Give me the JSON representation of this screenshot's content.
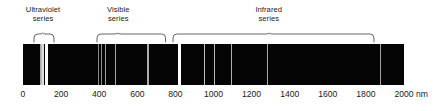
{
  "figure": {
    "axis_unit": "nm",
    "background_color": "#ffffff",
    "band_color": "#050505",
    "text_color": "#1b1b1b",
    "line_color": "#ffffff"
  },
  "series_labels": [
    {
      "name": "ultraviolet",
      "text": "Ultraviolet\nseries",
      "center_nm": 105,
      "brace_start_nm": 60,
      "brace_end_nm": 165
    },
    {
      "name": "visible",
      "text": "Visible\nseries",
      "center_nm": 500,
      "brace_start_nm": 390,
      "brace_end_nm": 750
    },
    {
      "name": "infrared",
      "text": "Infrared\nseries",
      "center_nm": 1290,
      "brace_start_nm": 785,
      "brace_end_nm": 1840
    }
  ],
  "axis": {
    "min_nm": 0,
    "max_nm": 2000,
    "ticks": [
      0,
      200,
      400,
      600,
      800,
      1000,
      1200,
      1400,
      1600,
      1800,
      2000
    ],
    "tick_labels": [
      "0",
      "200",
      "400",
      "600",
      "800",
      "1000",
      "1200",
      "1400",
      "1600",
      "1800",
      "2000"
    ],
    "unit": "nm"
  },
  "chart_data": {
    "type": "line",
    "xlabel": "nm",
    "ylabel": "",
    "xlim": [
      0,
      2000
    ],
    "grid": false,
    "legend": "none",
    "series": [
      {
        "name": "Ultraviolet series (Lyman)",
        "lines_nm": [
          91.2,
          93.8,
          95.0,
          97.3,
          102.6,
          121.6
        ],
        "intensities": [
          0.35,
          0.35,
          0.4,
          0.55,
          0.75,
          1.0
        ]
      },
      {
        "name": "Visible series (Balmer)",
        "lines_nm": [
          397.0,
          410.2,
          434.1,
          486.1,
          656.3
        ],
        "intensities": [
          0.18,
          0.22,
          0.3,
          0.38,
          0.42
        ]
      },
      {
        "name": "Infrared series (Paschen and beyond)",
        "lines_nm": [
          820.4,
          954.6,
          1005.0,
          1093.8,
          1281.8,
          1875.1
        ],
        "intensities": [
          1.0,
          0.55,
          0.5,
          0.45,
          0.4,
          0.35
        ]
      }
    ]
  }
}
